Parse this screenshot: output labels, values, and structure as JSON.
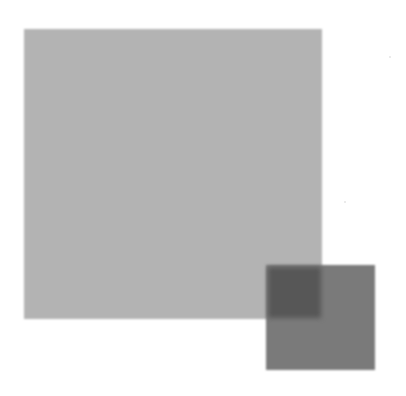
{
  "figure": {
    "background_color": "#ffffff",
    "shapes": [
      {
        "name": "large-square",
        "color": "#b3b3b3",
        "x": 24,
        "y": 29,
        "width": 298,
        "height": 290
      },
      {
        "name": "small-square",
        "color": "#7a7a7a",
        "x": 266,
        "y": 265,
        "width": 109,
        "height": 105
      },
      {
        "name": "overlap-region",
        "color": "#575757",
        "x": 266,
        "y": 265,
        "width": 56,
        "height": 54
      }
    ]
  }
}
